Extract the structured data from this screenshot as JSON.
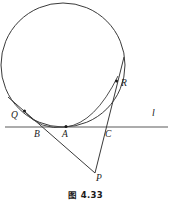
{
  "figure": {
    "caption": "图 4.33",
    "labels": {
      "Q": "Q",
      "B": "B",
      "A": "A",
      "C": "C",
      "R": "R",
      "P": "P",
      "l": "l"
    },
    "colors": {
      "stroke": "#3a3a3a",
      "line_l": "#5a5a5a",
      "text": "#1a1a1a",
      "background": "#ffffff"
    },
    "geometry": {
      "circle": {
        "cx": 63,
        "cy": 65,
        "r": 62
      },
      "line_l": {
        "x1": 5,
        "y1": 127,
        "x2": 168,
        "y2": 127
      },
      "points": {
        "A": {
          "x": 66,
          "y": 126.5
        },
        "Q": {
          "x": 25,
          "y": 112
        },
        "R": {
          "x": 116,
          "y": 82
        },
        "P": {
          "x": 95,
          "y": 173
        },
        "B": {
          "x": 41,
          "y": 127
        },
        "C": {
          "x": 104,
          "y": 127
        }
      },
      "secant_PQ": {
        "x1": 95,
        "y1": 173,
        "x2": 8,
        "y2": 97
      },
      "secant_PR": {
        "x1": 95,
        "y1": 173,
        "x2": 124,
        "y2": 57
      },
      "chord_QA_arc": "tangent arc of circle through Q, B-region and A"
    }
  }
}
